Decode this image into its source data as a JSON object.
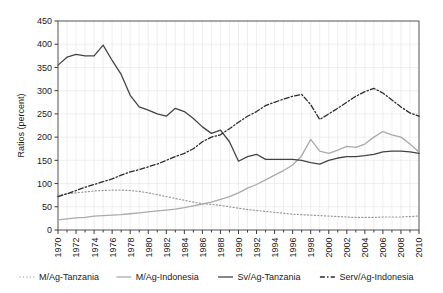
{
  "chart_data": {
    "type": "line",
    "title": "",
    "xlabel": "",
    "ylabel": "Ratios (percent)",
    "xlim": [
      1970,
      2010
    ],
    "ylim": [
      0,
      450
    ],
    "ytick_step": 50,
    "xtick_step": 2,
    "grid": true,
    "legend_position": "below",
    "yticks": [
      "0",
      "50",
      "100",
      "150",
      "200",
      "250",
      "300",
      "350",
      "400",
      "450"
    ],
    "xticks": [
      "1970",
      "1972",
      "1974",
      "1976",
      "1978",
      "1980",
      "1982",
      "1984",
      "1986",
      "1988",
      "1990",
      "1992",
      "1994",
      "1996",
      "1998",
      "2000",
      "2002",
      "2004",
      "2006",
      "2008",
      "2010"
    ],
    "x": [
      1970,
      1971,
      1972,
      1973,
      1974,
      1975,
      1976,
      1977,
      1978,
      1979,
      1980,
      1981,
      1982,
      1983,
      1984,
      1985,
      1986,
      1987,
      1988,
      1989,
      1990,
      1991,
      1992,
      1993,
      1994,
      1995,
      1996,
      1997,
      1998,
      1999,
      2000,
      2001,
      2002,
      2003,
      2004,
      2005,
      2006,
      2007,
      2008,
      2009,
      2010
    ],
    "series": [
      {
        "name": "M/Ag-Tanzania",
        "style": "dotted",
        "color": "#9a9a9a",
        "values": [
          75,
          78,
          80,
          82,
          84,
          85,
          86,
          86,
          85,
          83,
          80,
          76,
          72,
          68,
          64,
          60,
          57,
          55,
          53,
          50,
          47,
          44,
          42,
          40,
          38,
          36,
          34,
          33,
          32,
          31,
          30,
          29,
          28,
          27,
          27,
          27,
          28,
          28,
          28,
          29,
          30
        ]
      },
      {
        "name": "M/Ag-Indonesia",
        "style": "solid",
        "color": "#aaaaaa",
        "values": [
          22,
          24,
          26,
          27,
          30,
          31,
          32,
          33,
          35,
          37,
          39,
          41,
          43,
          45,
          48,
          52,
          56,
          60,
          66,
          72,
          80,
          90,
          98,
          108,
          118,
          128,
          140,
          160,
          195,
          170,
          165,
          172,
          180,
          178,
          185,
          200,
          212,
          205,
          200,
          185,
          168
        ]
      },
      {
        "name": "Sv/Ag-Tanzania",
        "style": "solid",
        "color": "#444444",
        "values": [
          355,
          372,
          378,
          375,
          375,
          398,
          365,
          335,
          290,
          265,
          258,
          250,
          245,
          262,
          255,
          240,
          222,
          208,
          215,
          190,
          148,
          158,
          163,
          152,
          152,
          152,
          152,
          150,
          145,
          142,
          150,
          155,
          158,
          158,
          160,
          163,
          168,
          170,
          170,
          168,
          165
        ]
      },
      {
        "name": "Serv/Ag-Indonesia",
        "style": "dashdot",
        "color": "#2b2b2b",
        "values": [
          72,
          78,
          85,
          92,
          98,
          104,
          110,
          118,
          125,
          130,
          136,
          142,
          150,
          158,
          165,
          175,
          190,
          200,
          205,
          218,
          232,
          245,
          255,
          268,
          275,
          282,
          288,
          292,
          270,
          238,
          250,
          262,
          275,
          288,
          298,
          305,
          295,
          280,
          265,
          252,
          245
        ]
      }
    ]
  },
  "legend": {
    "items": [
      {
        "label": "M/Ag-Tanzania"
      },
      {
        "label": "M/Ag-Indonesia"
      },
      {
        "label": "Sv/Ag-Tanzania"
      },
      {
        "label": "Serv/Ag-Indonesia"
      }
    ]
  }
}
